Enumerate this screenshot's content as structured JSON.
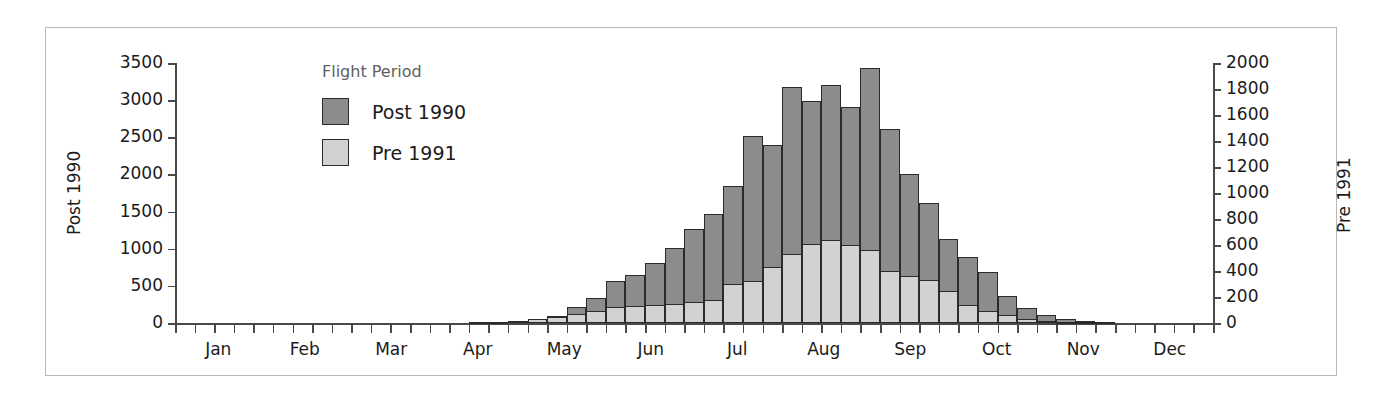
{
  "legend": {
    "title": "Flight Period",
    "items": [
      {
        "label": "Post 1990",
        "color": "#8c8c8c"
      },
      {
        "label": "Pre 1991",
        "color": "#d2d2d2"
      }
    ]
  },
  "axes": {
    "left_title": "Post 1990",
    "right_title": "Pre 1991",
    "left_ticks": [
      "0",
      "500",
      "1000",
      "1500",
      "2000",
      "2500",
      "3000",
      "3500"
    ],
    "right_ticks": [
      "0",
      "200",
      "400",
      "600",
      "800",
      "1000",
      "1200",
      "1400",
      "1600",
      "1800",
      "2000"
    ],
    "months": [
      "Jan",
      "Feb",
      "Mar",
      "Apr",
      "May",
      "Jun",
      "Jul",
      "Aug",
      "Sep",
      "Oct",
      "Nov",
      "Dec"
    ]
  },
  "chart_data": {
    "type": "bar",
    "title": "",
    "xlabel": "",
    "ylabel": "Post 1990",
    "y2label": "Pre 1991",
    "ylim": [
      0,
      3500
    ],
    "y2lim": [
      0,
      2000
    ],
    "grid": false,
    "legend_position": "inside-top-left",
    "stacked": false,
    "overlaid": true,
    "bin": "week",
    "categories": [
      "Jan wk1",
      "Jan wk2",
      "Jan wk3",
      "Jan wk4",
      "Feb wk1",
      "Feb wk2",
      "Feb wk3",
      "Feb wk4",
      "Mar wk1",
      "Mar wk2",
      "Mar wk3",
      "Mar wk4",
      "Apr wk1",
      "Apr wk2",
      "Apr wk3",
      "Apr wk4",
      "May wk1",
      "May wk2",
      "May wk3",
      "May wk4",
      "Jun wk1",
      "Jun wk2",
      "Jun wk3",
      "Jun wk4",
      "Jul wk1",
      "Jul wk2",
      "Jul wk3",
      "Jul wk4",
      "Aug wk1",
      "Aug wk2",
      "Aug wk3",
      "Aug wk4",
      "Sep wk1",
      "Sep wk2",
      "Sep wk3",
      "Sep wk4",
      "Oct wk1",
      "Oct wk2",
      "Oct wk3",
      "Oct wk4",
      "Nov wk1",
      "Nov wk2",
      "Nov wk3",
      "Nov wk4",
      "Dec wk1",
      "Dec wk2",
      "Dec wk3",
      "Dec wk4",
      "Dec wk5",
      "Dec wk6",
      "Dec wk7",
      "Dec wk8",
      "Dec wk9"
    ],
    "series": [
      {
        "name": "Post 1990",
        "axis": "left",
        "color": "#8c8c8c",
        "values": [
          0,
          0,
          0,
          0,
          0,
          0,
          0,
          0,
          0,
          0,
          0,
          0,
          0,
          0,
          0,
          10,
          20,
          30,
          60,
          90,
          220,
          330,
          560,
          640,
          810,
          1010,
          1270,
          1470,
          1840,
          2520,
          2390,
          3180,
          2990,
          3210,
          2910,
          3430,
          2610,
          2010,
          1620,
          1130,
          890,
          690,
          370,
          200,
          110,
          60,
          30,
          10,
          0,
          0,
          0,
          0,
          0
        ]
      },
      {
        "name": "Pre 1991",
        "axis": "right",
        "color": "#d2d2d2",
        "values": [
          0,
          0,
          0,
          0,
          0,
          0,
          0,
          0,
          0,
          0,
          0,
          0,
          0,
          0,
          0,
          5,
          10,
          15,
          30,
          45,
          70,
          90,
          120,
          130,
          140,
          145,
          160,
          175,
          300,
          320,
          430,
          530,
          610,
          640,
          600,
          560,
          400,
          360,
          330,
          250,
          140,
          95,
          60,
          30,
          15,
          8,
          4,
          0,
          0,
          0,
          0,
          0,
          0
        ]
      }
    ]
  }
}
